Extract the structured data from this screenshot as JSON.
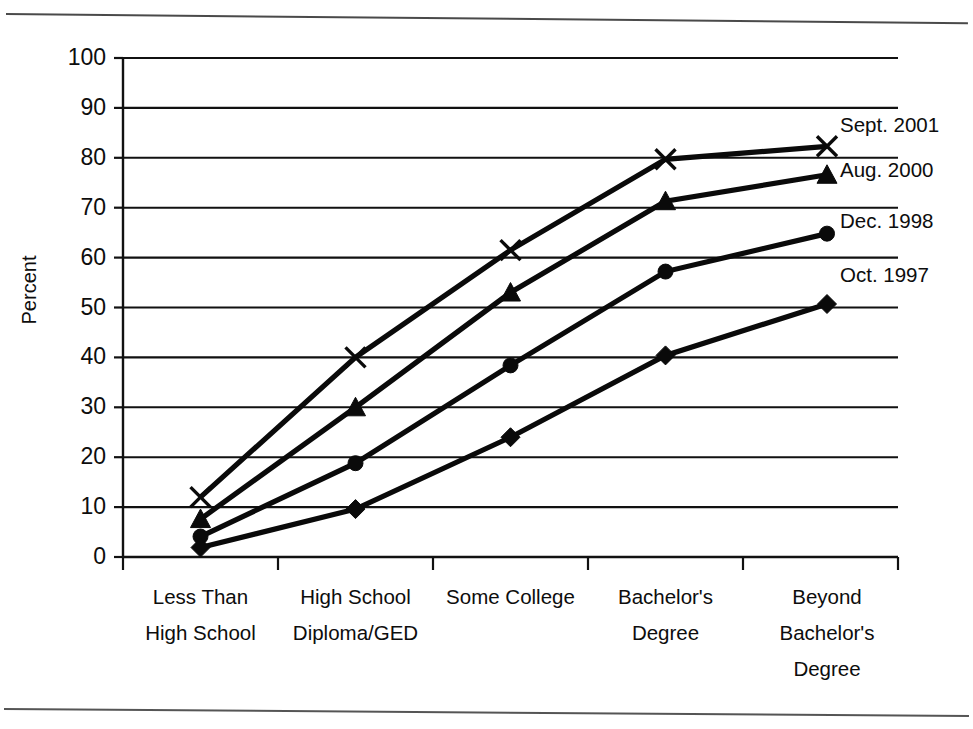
{
  "chart_data": {
    "type": "line",
    "title": "",
    "xlabel": "",
    "ylabel": "Percent",
    "ylim": [
      0,
      100
    ],
    "ytick_labels": [
      "0",
      "10",
      "20",
      "30",
      "40",
      "50",
      "60",
      "70",
      "80",
      "90",
      "100"
    ],
    "ytick_values": [
      0,
      10,
      20,
      30,
      40,
      50,
      60,
      70,
      80,
      90,
      100
    ],
    "grid": true,
    "legend_position": "right-inline-end-of-line",
    "categories": [
      "Less Than High School",
      "High School Diploma/GED",
      "Some College",
      "Bachelor's Degree",
      "Beyond Bachelor's Degree"
    ],
    "category_label_lines": [
      [
        "Less Than",
        "High School"
      ],
      [
        "High School",
        "Diploma/GED"
      ],
      [
        "Some College"
      ],
      [
        "Bachelor's",
        "Degree"
      ],
      [
        "Beyond",
        "Bachelor's",
        "Degree"
      ]
    ],
    "series": [
      {
        "name": "Sept. 2001",
        "marker": "x",
        "values": [
          12.0,
          40.0,
          61.5,
          79.7,
          82.3
        ]
      },
      {
        "name": "Aug. 2000",
        "marker": "triangle",
        "values": [
          7.6,
          30.0,
          53.0,
          71.3,
          76.6
        ]
      },
      {
        "name": "Dec. 1998",
        "marker": "circle",
        "values": [
          4.1,
          18.8,
          38.4,
          57.2,
          64.8
        ]
      },
      {
        "name": "Oct. 1997",
        "marker": "diamond",
        "values": [
          1.9,
          9.6,
          24.0,
          40.4,
          50.7
        ]
      }
    ]
  },
  "figure": {
    "top_rule": "horizontal-rule",
    "bottom_rule": "horizontal-rule"
  }
}
